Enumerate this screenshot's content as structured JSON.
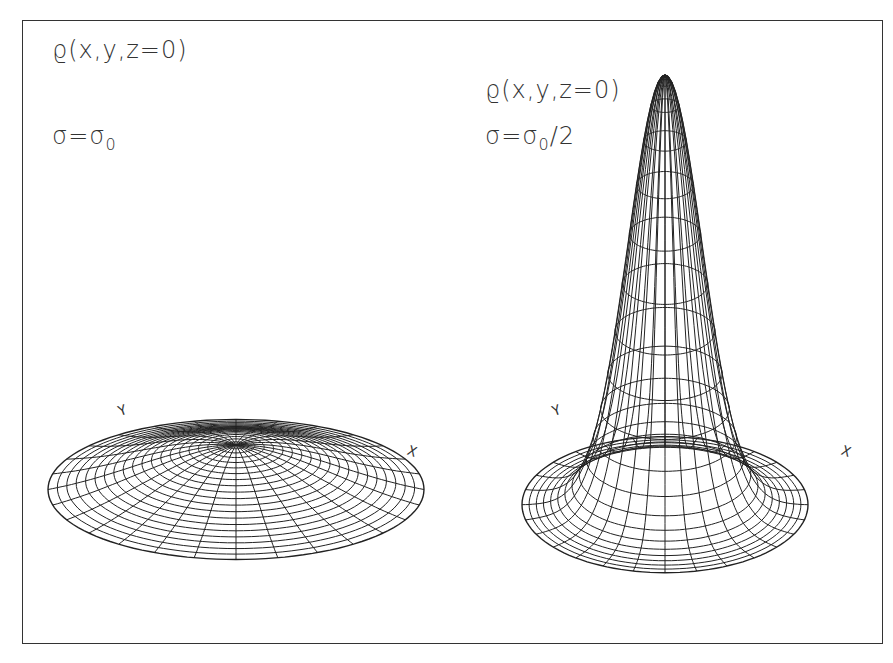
{
  "figure": {
    "panels": [
      {
        "id": "left",
        "title": "ϱ(x,y,z=0)",
        "sigma_prefix": "σ=σ",
        "sigma_sub": "0",
        "sigma_suffix": "",
        "axis_y_label": "Y",
        "axis_x_label": "X",
        "surface": {
          "cx": 236,
          "cy": 500,
          "rx": 188,
          "ry": 70,
          "peak": 55,
          "width": 0.55,
          "rings": 20,
          "spokes": 28
        }
      },
      {
        "id": "right",
        "title": "ϱ(x,y,z=0)",
        "sigma_prefix": "σ=σ",
        "sigma_sub": "0",
        "sigma_suffix": "/2",
        "axis_y_label": "Y",
        "axis_x_label": "X",
        "surface": {
          "cx": 665,
          "cy": 505,
          "rx": 143,
          "ry": 68,
          "peak": 430,
          "width": 0.26,
          "rings": 20,
          "spokes": 28
        }
      }
    ],
    "line_color": "#222222"
  }
}
